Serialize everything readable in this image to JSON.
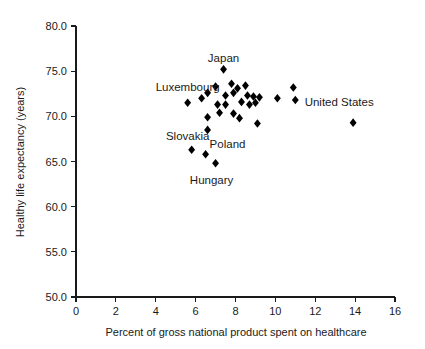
{
  "chart_data": {
    "type": "scatter",
    "title": "",
    "xlabel": "Percent of gross national product spent on healthcare",
    "ylabel": "Healthy life expectancy (years)",
    "xlim": [
      0,
      16
    ],
    "ylim": [
      50.0,
      80.0
    ],
    "xticks": [
      0,
      2,
      4,
      6,
      8,
      10,
      12,
      14,
      16
    ],
    "xtick_labels": [
      "0",
      "2",
      "4",
      "6",
      "8",
      "10",
      "12",
      "14",
      "16"
    ],
    "yticks": [
      50.0,
      55.0,
      60.0,
      65.0,
      70.0,
      75.0,
      80.0
    ],
    "ytick_labels": [
      "50.0",
      "55.0",
      "60.0",
      "65.0",
      "70.0",
      "75.0",
      "80.0"
    ],
    "grid": false,
    "legend": false,
    "marker": "diamond",
    "marker_color": "#000000",
    "points": [
      {
        "x": 5.6,
        "y": 71.5
      },
      {
        "x": 6.3,
        "y": 72.0
      },
      {
        "x": 6.6,
        "y": 69.9
      },
      {
        "x": 5.8,
        "y": 66.3
      },
      {
        "x": 6.5,
        "y": 65.8
      },
      {
        "x": 7.0,
        "y": 64.8
      },
      {
        "x": 6.6,
        "y": 68.5
      },
      {
        "x": 6.6,
        "y": 72.6
      },
      {
        "x": 7.1,
        "y": 71.3
      },
      {
        "x": 7.2,
        "y": 70.4
      },
      {
        "x": 7.0,
        "y": 73.3
      },
      {
        "x": 7.5,
        "y": 72.3
      },
      {
        "x": 7.5,
        "y": 71.3
      },
      {
        "x": 7.4,
        "y": 75.2
      },
      {
        "x": 7.8,
        "y": 73.6
      },
      {
        "x": 7.9,
        "y": 72.6
      },
      {
        "x": 7.9,
        "y": 70.3
      },
      {
        "x": 8.1,
        "y": 73.1
      },
      {
        "x": 8.3,
        "y": 71.6
      },
      {
        "x": 8.5,
        "y": 73.4
      },
      {
        "x": 8.6,
        "y": 72.3
      },
      {
        "x": 8.7,
        "y": 71.3
      },
      {
        "x": 8.9,
        "y": 72.2
      },
      {
        "x": 9.0,
        "y": 71.5
      },
      {
        "x": 9.2,
        "y": 72.1
      },
      {
        "x": 9.1,
        "y": 69.2
      },
      {
        "x": 8.2,
        "y": 69.8
      },
      {
        "x": 10.1,
        "y": 72.0
      },
      {
        "x": 10.9,
        "y": 73.2
      },
      {
        "x": 11.0,
        "y": 71.8
      },
      {
        "x": 13.9,
        "y": 69.3
      }
    ],
    "annotations": [
      {
        "text": "Japan",
        "x": 7.4,
        "y": 76.5
      },
      {
        "text": "Luxembourg",
        "x": 5.6,
        "y": 73.2
      },
      {
        "text": "Slovakia",
        "x": 5.6,
        "y": 67.8
      },
      {
        "text": "Poland",
        "x": 7.6,
        "y": 66.9
      },
      {
        "text": "Hungary",
        "x": 6.8,
        "y": 62.9
      },
      {
        "text": "United States",
        "x": 13.2,
        "y": 71.6
      }
    ]
  }
}
